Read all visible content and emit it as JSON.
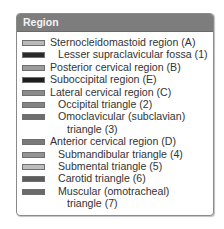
{
  "legend": {
    "title": "Region",
    "header_color": "#7d7d7d",
    "items": [
      {
        "label": "Sternocleidomastoid region (A)",
        "indent": false,
        "color": "#b9b9b9"
      },
      {
        "label": "Lesser supraclavicular fossa (1)",
        "indent": true,
        "color": "#2a2a2a"
      },
      {
        "label": "Posterior cervical region (B)",
        "indent": false,
        "color": "#9c9c9c"
      },
      {
        "label": "Suboccipital region (E)",
        "indent": false,
        "color": "#1e1e1e"
      },
      {
        "label": "Lateral cervical region (C)",
        "indent": false,
        "color": "#8c8c8c"
      },
      {
        "label": "Occipital triangle (2)",
        "indent": true,
        "color": "#838383"
      },
      {
        "label": "Omoclavicular (subclavian)",
        "label_cont": "triangle (3)",
        "indent": true,
        "color": "#6e6e6e"
      },
      {
        "label": "Anterior cervical region (D)",
        "indent": false,
        "color": "#7a7a7a"
      },
      {
        "label": "Submandibular triangle (4)",
        "indent": true,
        "color": "#949494"
      },
      {
        "label": "Submental triangle (5)",
        "indent": true,
        "color": "#bdbdbd"
      },
      {
        "label": "Carotid triangle (6)",
        "indent": true,
        "color": "#5c5c5c"
      },
      {
        "label": "Muscular (omotracheal)",
        "label_cont": "triangle (7)",
        "indent": true,
        "color": "#6a6a6a"
      }
    ]
  }
}
